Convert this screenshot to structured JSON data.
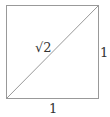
{
  "diagram": {
    "shape": "square",
    "stroke_color": "#999999",
    "labels": {
      "diagonal": "√2",
      "right_side": "1",
      "bottom_side": "1"
    }
  }
}
